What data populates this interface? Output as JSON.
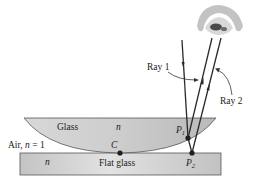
{
  "diagram": {
    "type": "optics-newtons-rings",
    "labels": {
      "ray1": "Ray 1",
      "ray2": "Ray 2",
      "glass": "Glass",
      "lens_index": "n",
      "air": "Air, n = 1",
      "air_prefix": "Air, ",
      "air_n": "n",
      "air_suffix": " = 1",
      "flat_index": "n",
      "flat_glass": "Flat glass",
      "point_c": "C",
      "point_p1": "P",
      "point_p1_sub": "1",
      "point_p2": "P",
      "point_p2_sub": "2"
    },
    "colors": {
      "lens_fill": "#c9c9c9",
      "flat_fill": "#cfcfcf",
      "stroke": "#333333",
      "ray": "#2a2a2a",
      "dot": "#1e1e1e",
      "eye": "#9a9a9a"
    }
  }
}
